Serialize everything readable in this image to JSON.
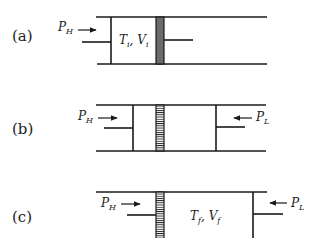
{
  "panels": [
    {
      "label": "(a)",
      "left_pressure": {
        "symbol": "P",
        "sub": "H"
      },
      "chamber_state": {
        "t": "T",
        "t_sub": "i",
        "v": "V",
        "v_sub": "i",
        "sep": ", "
      },
      "piston_style": "solid-gray"
    },
    {
      "label": "(b)",
      "left_pressure": {
        "symbol": "P",
        "sub": "H"
      },
      "right_pressure": {
        "symbol": "P",
        "sub": "L"
      },
      "piston_style": "hatched"
    },
    {
      "label": "(c)",
      "left_pressure": {
        "symbol": "P",
        "sub": "H"
      },
      "right_pressure": {
        "symbol": "P",
        "sub": "L"
      },
      "chamber_state": {
        "t": "T",
        "t_sub": "f",
        "v": "V",
        "v_sub": "f",
        "sep": ", "
      },
      "piston_style": "hatched"
    }
  ],
  "colors": {
    "line": "#1a1a1a",
    "solid_piston": "#6b6b6b",
    "hatch": "#1a1a1a"
  }
}
